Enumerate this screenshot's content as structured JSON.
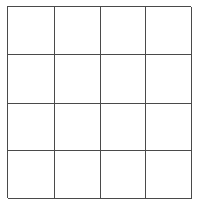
{
  "diagram": {
    "type": "grid",
    "rows": 4,
    "columns": 4,
    "line_color": "#4a4a4a",
    "background_color": "#ffffff",
    "cells": [
      [
        "",
        "",
        "",
        ""
      ],
      [
        "",
        "",
        "",
        ""
      ],
      [
        "",
        "",
        "",
        ""
      ],
      [
        "",
        "",
        "",
        ""
      ]
    ]
  }
}
